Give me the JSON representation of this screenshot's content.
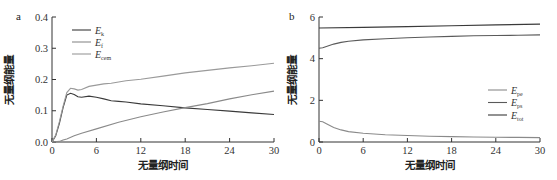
{
  "chart_data": [
    {
      "panel": "a",
      "type": "line",
      "title": "",
      "xlabel": "无量纲时间",
      "ylabel": "无量纲能量",
      "xlim": [
        0,
        30
      ],
      "ylim": [
        0,
        0.4
      ],
      "xticks": [
        0,
        6,
        12,
        18,
        24,
        30
      ],
      "yticks": [
        "0.0",
        "0.1",
        "0.2",
        "0.3",
        "0.4"
      ],
      "grid": false,
      "legend_position": "upper-left",
      "series": [
        {
          "name": "E_k",
          "label_main": "E",
          "label_sub": "k",
          "color": "#3a3a3a",
          "x": [
            0,
            0.5,
            1,
            1.5,
            2,
            2.5,
            3,
            3.5,
            4,
            5,
            6,
            7,
            8,
            9,
            10,
            12,
            15,
            18,
            21,
            24,
            27,
            30
          ],
          "y": [
            0,
            0.02,
            0.06,
            0.11,
            0.15,
            0.156,
            0.152,
            0.145,
            0.143,
            0.147,
            0.143,
            0.138,
            0.132,
            0.13,
            0.128,
            0.122,
            0.116,
            0.109,
            0.104,
            0.099,
            0.093,
            0.088
          ]
        },
        {
          "name": "E_f",
          "label_main": "E",
          "label_sub": "f",
          "color": "#8a8a8a",
          "x": [
            0,
            1,
            1.5,
            2,
            3,
            4,
            6,
            9,
            12,
            15,
            18,
            21,
            24,
            27,
            30
          ],
          "y": [
            0,
            0.002,
            0.006,
            0.01,
            0.02,
            0.028,
            0.042,
            0.063,
            0.081,
            0.096,
            0.11,
            0.123,
            0.138,
            0.151,
            0.163
          ]
        },
        {
          "name": "E_cem",
          "label_main": "E",
          "label_sub": "cem",
          "color": "#9a9a9a",
          "x": [
            0,
            0.5,
            1,
            1.5,
            2,
            2.5,
            3,
            3.5,
            4,
            5,
            6,
            7,
            8,
            9,
            10,
            12,
            15,
            18,
            21,
            24,
            27,
            30
          ],
          "y": [
            0,
            0.022,
            0.065,
            0.115,
            0.158,
            0.172,
            0.17,
            0.166,
            0.168,
            0.178,
            0.182,
            0.186,
            0.188,
            0.192,
            0.196,
            0.201,
            0.211,
            0.221,
            0.229,
            0.237,
            0.244,
            0.252
          ]
        }
      ]
    },
    {
      "panel": "b",
      "type": "line",
      "title": "",
      "xlabel": "无量纲时间",
      "ylabel": "无量纲能量",
      "xlim": [
        0,
        30
      ],
      "ylim": [
        0,
        6
      ],
      "xticks": [
        0,
        6,
        12,
        18,
        24,
        30
      ],
      "yticks": [
        "0",
        "2",
        "4",
        "6"
      ],
      "grid": false,
      "legend_position": "center-right",
      "series": [
        {
          "name": "E_pe",
          "label_main": "E",
          "label_sub": "pe",
          "color": "#8a8a8a",
          "x": [
            0,
            0.5,
            1,
            2,
            3,
            4,
            6,
            9,
            12,
            15,
            18,
            21,
            24,
            27,
            30
          ],
          "y": [
            1.0,
            0.97,
            0.88,
            0.7,
            0.58,
            0.5,
            0.42,
            0.35,
            0.31,
            0.28,
            0.26,
            0.24,
            0.23,
            0.22,
            0.21
          ]
        },
        {
          "name": "E_ps",
          "label_main": "E",
          "label_sub": "ps",
          "color": "#5a5a5a",
          "x": [
            0,
            0.5,
            1,
            2,
            3,
            4,
            6,
            9,
            12,
            15,
            18,
            21,
            24,
            27,
            30
          ],
          "y": [
            4.5,
            4.52,
            4.58,
            4.7,
            4.78,
            4.84,
            4.9,
            4.96,
            5.0,
            5.04,
            5.07,
            5.1,
            5.11,
            5.12,
            5.14
          ]
        },
        {
          "name": "E_tot",
          "label_main": "E",
          "label_sub": "tot",
          "color": "#3a3a3a",
          "x": [
            0,
            6,
            12,
            18,
            24,
            30
          ],
          "y": [
            5.47,
            5.5,
            5.54,
            5.58,
            5.62,
            5.66
          ]
        }
      ]
    }
  ]
}
